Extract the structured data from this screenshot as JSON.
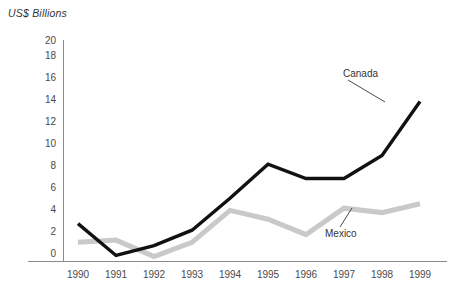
{
  "chart_data": {
    "type": "line",
    "title": "",
    "ylabel": "US$ Billions",
    "xlabel": "",
    "x": [
      1990,
      1991,
      1992,
      1993,
      1994,
      1995,
      1996,
      1997,
      1998,
      1999
    ],
    "categories": [
      "1990",
      "1991",
      "1992",
      "1993",
      "1994",
      "1995",
      "1996",
      "1997",
      "1998",
      "1999"
    ],
    "ylim": [
      0,
      20
    ],
    "ytick_values": [
      0,
      2,
      4,
      6,
      8,
      10,
      12,
      14,
      16,
      18,
      20
    ],
    "ytick_labels": [
      "0",
      "2",
      "4",
      "6",
      "8",
      "10",
      "12",
      "14",
      "16",
      "18",
      "20"
    ],
    "grid": false,
    "legend": "inline-annotations",
    "series": [
      {
        "name": "Canada",
        "color": "#111111",
        "values": [
          3.4,
          0.5,
          1.4,
          2.8,
          5.7,
          8.8,
          7.5,
          7.5,
          9.6,
          14.5
        ]
      },
      {
        "name": "Mexico",
        "color": "#c9c9c9",
        "values": [
          1.7,
          1.9,
          0.4,
          1.7,
          4.6,
          3.8,
          2.4,
          4.8,
          4.4,
          5.2
        ]
      }
    ],
    "annotations": [
      {
        "text": "Canada",
        "series": "Canada",
        "anchor_year": 1999
      },
      {
        "text": "Mexico",
        "series": "Mexico",
        "anchor_year": 1997
      }
    ]
  },
  "axis": {
    "line_color": "#7a7a7a"
  }
}
